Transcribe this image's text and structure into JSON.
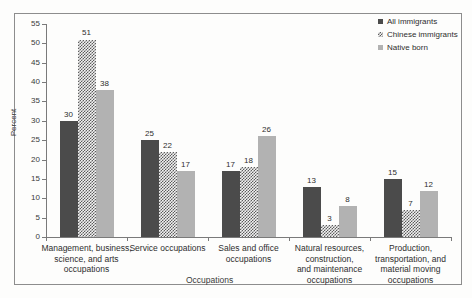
{
  "chart_data": {
    "type": "bar",
    "title": "",
    "xlabel": "Occupations",
    "ylabel": "Percent",
    "ylim": [
      0,
      55
    ],
    "ytick_step": 5,
    "yticks": [
      55,
      50,
      45,
      40,
      35,
      30,
      25,
      20,
      15,
      10,
      5,
      0
    ],
    "grid": false,
    "legend_position": "top-right",
    "categories": [
      "Management, business, science, and arts occupations",
      "Service occupations",
      "Sales and office occupations",
      "Natural resources, construction, and maintenance occupations",
      "Production, transportation, and material moving occupations"
    ],
    "category_lines": [
      [
        "Management, business,",
        "science, and arts",
        "occupations"
      ],
      [
        "Service occupations"
      ],
      [
        "Sales and office",
        "occupations"
      ],
      [
        "Natural resources,",
        "construction,",
        "and maintenance",
        "occupations"
      ],
      [
        "Production,",
        "transportation, and",
        "material moving",
        "occupations"
      ]
    ],
    "series": [
      {
        "name": "All immigrants",
        "color": "#4b4b4b",
        "pattern": "solid-dark",
        "values": [
          30,
          25,
          17,
          13,
          15
        ]
      },
      {
        "name": "Chinese immigrants",
        "color": "#5c5c5c",
        "pattern": "checkerboard",
        "values": [
          51,
          22,
          18,
          3,
          7
        ]
      },
      {
        "name": "Native born",
        "color": "#b2b2b2",
        "pattern": "solid-light",
        "values": [
          38,
          17,
          26,
          8,
          12
        ]
      }
    ]
  },
  "legend": {
    "items": [
      {
        "label": "All immigrants",
        "swatch": "legend-swatch-all-immigrants"
      },
      {
        "label": "Chinese immigrants",
        "swatch": "legend-swatch-chinese-immigrants"
      },
      {
        "label": "Native born",
        "swatch": "legend-swatch-native-born"
      }
    ]
  },
  "axes": {
    "y_title": "Percent",
    "x_title": "Occupations"
  }
}
